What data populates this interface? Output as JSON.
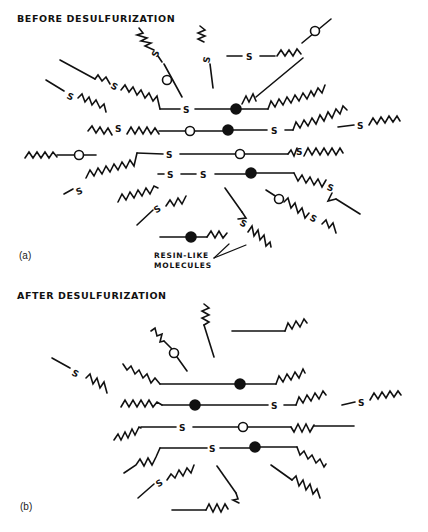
{
  "figure": {
    "panel_a": {
      "title": "BEFORE DESULFURIZATION",
      "label": "(a)",
      "annotation_line1": "RESIN-LIKE",
      "annotation_line2": "MOLECULES"
    },
    "panel_b": {
      "title": "AFTER DESULFURIZATION",
      "label": "(b)"
    },
    "legend_symbols": {
      "sulfur_atom": "S",
      "open_circle": "open-circle",
      "filled_circle": "filled-circle",
      "zigzag": "aliphatic-chain"
    },
    "colors": {
      "ink": "#111111",
      "background": "#ffffff"
    }
  }
}
